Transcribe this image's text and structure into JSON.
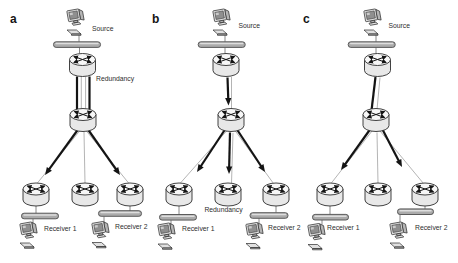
{
  "figure": {
    "background": "#ffffff",
    "colors": {
      "outline": "#2e2e2e",
      "router_body": "#e8e8e8",
      "router_top": "#f7f7f7",
      "bar_fill": "#ababab",
      "bar_stroke": "#4d4d4d",
      "computer_fill": "#e0e0e0",
      "screen_fill": "#8f8f8f",
      "thin_link": "#9b9b9b",
      "bold_link": "#141414",
      "label_color": "#2e2e2e"
    },
    "panels": [
      {
        "label": "a",
        "source_label": "Source",
        "redundancy_label": "Redundancy",
        "receiver_labels": [
          "Receiver 1",
          "Receiver 2"
        ]
      },
      {
        "label": "b",
        "source_label": "Source",
        "redundancy_label": "Redundancy",
        "receiver_labels": [
          "Receiver 1",
          "Receiver 2"
        ]
      },
      {
        "label": "c",
        "source_label": "Source",
        "receiver_labels": [
          "Receiver 1",
          "Receiver 2"
        ]
      }
    ]
  }
}
